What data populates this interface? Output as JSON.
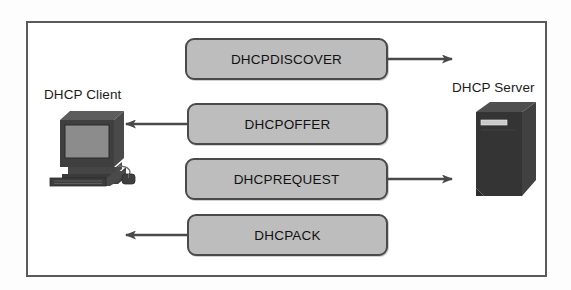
{
  "diagram": {
    "frame": {
      "border_color": "#5a5a5a"
    },
    "nodes": [
      {
        "id": "dhcp-client",
        "label": "DHCP Client",
        "icon": "desktop-computer-icon"
      },
      {
        "id": "dhcp-server",
        "label": "DHCP Server",
        "icon": "server-tower-icon"
      }
    ],
    "messages": [
      {
        "id": "discover",
        "label": "DHCPDISCOVER",
        "direction": "client-to-server",
        "arrow": "right",
        "order": 1
      },
      {
        "id": "offer",
        "label": "DHCPOFFER",
        "direction": "server-to-client",
        "arrow": "left",
        "order": 2
      },
      {
        "id": "request",
        "label": "DHCPREQUEST",
        "direction": "client-to-server",
        "arrow": "right",
        "order": 3
      },
      {
        "id": "ack",
        "label": "DHCPACK",
        "direction": "server-to-client",
        "arrow": "left",
        "order": 4
      }
    ],
    "colors": {
      "box_fill": "#bdbdbd",
      "box_border": "#4a4a4a",
      "arrow": "#4a4a4a",
      "text": "#111111",
      "icon_dark": "#3b3b3b",
      "icon_mid": "#6e6e6e",
      "icon_light": "#9a9a9a",
      "background": "#ffffff"
    }
  }
}
